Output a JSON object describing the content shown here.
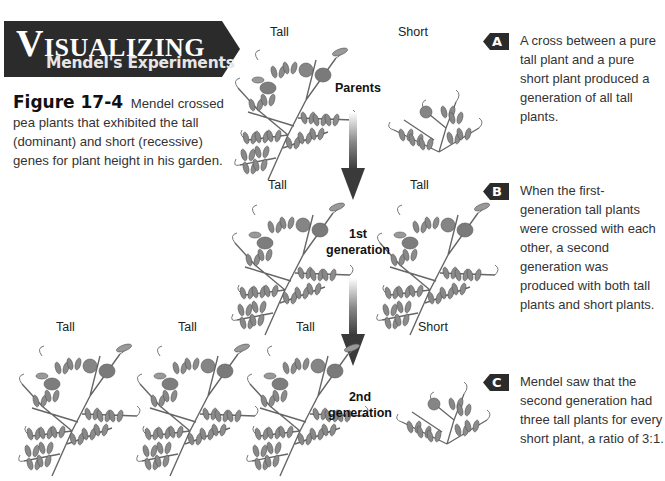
{
  "header": {
    "banner_cap": "V",
    "banner_title_rest": "ISUALIZING",
    "banner_subtitle": "Mendel's Experiments"
  },
  "caption": {
    "figure_label": "Figure 17-4",
    "text": "Mendel crossed pea plants that exhibited the tall (dominant) and short (recessive) genes for plant height in his garden."
  },
  "diagram": {
    "parents": {
      "label": "Parents",
      "plants": [
        {
          "label": "Tall"
        },
        {
          "label": "Short"
        }
      ]
    },
    "first_generation": {
      "label_line1": "1st",
      "label_line2": "generation",
      "plants": [
        {
          "label": "Tall"
        },
        {
          "label": "Tall"
        }
      ]
    },
    "second_generation": {
      "label_line1": "2nd",
      "label_line2": "generation",
      "plants": [
        {
          "label": "Tall"
        },
        {
          "label": "Tall"
        },
        {
          "label": "Tall"
        },
        {
          "label": "Short"
        }
      ]
    },
    "arrow_color": "#3a3a3a"
  },
  "notes": [
    {
      "badge": "A",
      "text": "A cross between a pure tall plant and a pure short plant produced a generation of all tall plants."
    },
    {
      "badge": "B",
      "text": "When the first-generation tall plants were crossed with each other, a second generation was produced with both tall plants and short plants."
    },
    {
      "badge": "C",
      "text": "Mendel saw that the second generation had three tall plants for every short plant, a ratio of 3:1."
    }
  ],
  "colors": {
    "banner_bg": "#2b2b2b",
    "badge_bg": "#2b2b2b",
    "plant_stroke": "#666666",
    "plant_leaf": "#8a8a8a"
  }
}
